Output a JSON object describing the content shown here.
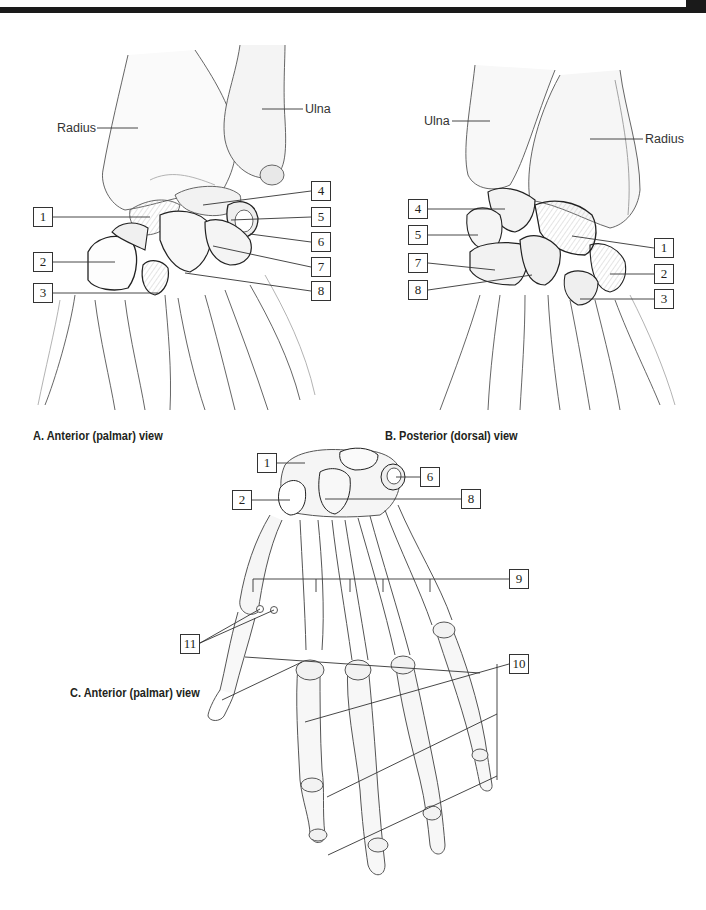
{
  "page": {
    "top_bar_color": "#1a1a1a",
    "line_color": "#333333"
  },
  "panels": [
    {
      "id": "A",
      "caption": "A. Anterior (palmar) view",
      "bone_names": [
        {
          "text": "Radius",
          "x": 57,
          "y": 121
        },
        {
          "text": "Ulna",
          "x": 304,
          "y": 103
        }
      ],
      "labels": [
        {
          "num": "1",
          "x": 33,
          "y": 207
        },
        {
          "num": "2",
          "x": 33,
          "y": 252
        },
        {
          "num": "3",
          "x": 33,
          "y": 283
        },
        {
          "num": "4",
          "x": 311,
          "y": 181
        },
        {
          "num": "5",
          "x": 311,
          "y": 207
        },
        {
          "num": "6",
          "x": 311,
          "y": 232
        },
        {
          "num": "7",
          "x": 311,
          "y": 257
        },
        {
          "num": "8",
          "x": 311,
          "y": 281
        }
      ]
    },
    {
      "id": "B",
      "caption": "B. Posterior (dorsal) view",
      "bone_names": [
        {
          "text": "Ulna",
          "x": 424,
          "y": 114
        },
        {
          "text": "Radius",
          "x": 645,
          "y": 132
        }
      ],
      "labels": [
        {
          "num": "4",
          "x": 408,
          "y": 199
        },
        {
          "num": "5",
          "x": 408,
          "y": 225
        },
        {
          "num": "7",
          "x": 408,
          "y": 253
        },
        {
          "num": "8",
          "x": 408,
          "y": 280
        },
        {
          "num": "1",
          "x": 654,
          "y": 238
        },
        {
          "num": "2",
          "x": 654,
          "y": 264
        },
        {
          "num": "3",
          "x": 654,
          "y": 289
        }
      ]
    },
    {
      "id": "C",
      "caption": "C. Anterior (palmar) view",
      "bone_names": [],
      "labels": [
        {
          "num": "1",
          "x": 257,
          "y": 453
        },
        {
          "num": "6",
          "x": 420,
          "y": 467
        },
        {
          "num": "2",
          "x": 232,
          "y": 490
        },
        {
          "num": "8",
          "x": 461,
          "y": 489
        },
        {
          "num": "9",
          "x": 509,
          "y": 569
        },
        {
          "num": "11",
          "x": 180,
          "y": 634
        },
        {
          "num": "10",
          "x": 509,
          "y": 654
        }
      ]
    }
  ]
}
